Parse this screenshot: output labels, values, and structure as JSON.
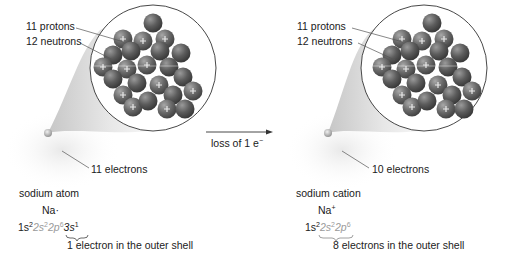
{
  "figure": {
    "arrow_label": "loss of 1 e",
    "arrow_label_sup": "−",
    "colors": {
      "nucleon": "#5a5a5a",
      "nucleon_highlight": "#9a9a9a",
      "cone": "#d9d9d9",
      "circle_stroke": "#333333",
      "leader_line": "#555555",
      "grey_text": "#9a9a9a"
    }
  },
  "left": {
    "protons_label": "11 protons",
    "neutrons_label": "12 neutrons",
    "electrons_label": "11 electrons",
    "name": "sodium atom",
    "symbol": "Na·",
    "config": {
      "p1": "1s",
      "p1_sup": "2",
      "p2": "2s",
      "p2_sup": "2",
      "p3": "2p",
      "p3_sup": "6",
      "p4": "3s",
      "p4_sup": "1"
    },
    "outer_shell_note": "1 electron in the outer shell"
  },
  "right": {
    "protons_label": "11 protons",
    "neutrons_label": "12 neutrons",
    "electrons_label": "10 electrons",
    "name": "sodium cation",
    "symbol": "Na",
    "symbol_sup": "+",
    "config": {
      "p1": "1s",
      "p1_sup": "2",
      "p2": "2s",
      "p2_sup": "2",
      "p3": "2p",
      "p3_sup": "6"
    },
    "outer_shell_note": "8 electrons in the outer shell"
  }
}
